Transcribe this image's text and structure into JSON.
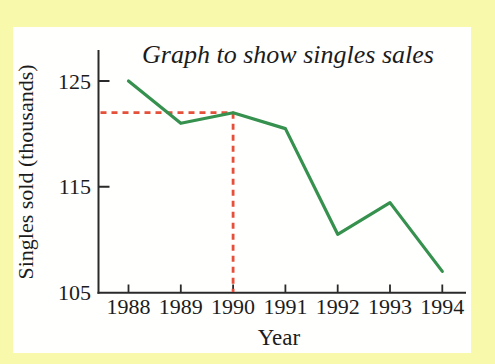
{
  "colors": {
    "background": "#f9f9ac",
    "panel": "#fffffd",
    "axis": "#2a2a2a",
    "text": "#1c1c1c",
    "line_green": "#35914d",
    "crosshair_red": "#e4503a"
  },
  "chart_data": {
    "type": "line",
    "title": "Graph to show singles sales",
    "xlabel": "Year",
    "ylabel": "Singles sold (thousands)",
    "categories": [
      "1988",
      "1989",
      "1990",
      "1991",
      "1992",
      "1993",
      "1994"
    ],
    "series": [
      {
        "name": "Singles sold (thousands)",
        "values": [
          125,
          121,
          122,
          120.5,
          110.5,
          113.5,
          107
        ]
      }
    ],
    "y_ticks": [
      105,
      115,
      125
    ],
    "y_tick_labels_top_to_bottom": [
      "125",
      "115",
      "105"
    ],
    "ylim": [
      105,
      128
    ],
    "grid": false,
    "legend": "none",
    "annotation": {
      "type": "crosshair-dashed",
      "x": "1990",
      "y": 122
    }
  }
}
